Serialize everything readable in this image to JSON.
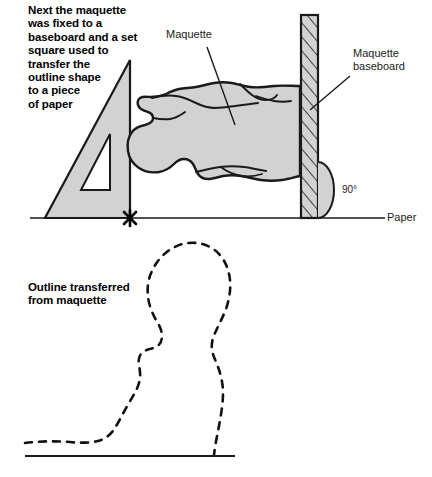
{
  "figure": {
    "title_block": {
      "heading": "Next the maquette\nwas fixed to a\nbaseboard and a set\nsquare used to\ntransfer the\noutline shape\nto a piece\nof paper",
      "caption": "Outline transferred\nfrom maquette"
    },
    "labels": {
      "maquette": "Maquette",
      "baseboard": "Maquette\nbaseboard",
      "angle": "90°",
      "paper": "Paper"
    },
    "colors": {
      "fill_gray": "#d2d2d2",
      "stroke": "#1a1a1a",
      "background": "#ffffff",
      "label_text": "#1c1c1c"
    },
    "elements": {
      "set_square": "right-triangle set square with inner triangular cutout, vertical edge at right",
      "maquette_blob": "gray organic reclining figure, head at left, resting against baseboard",
      "baseboard": "narrow vertical hatched board at right",
      "angle_arc": "quarter/semicircular gray arc marking the right angle at board base",
      "cross_mark": "bold x mark where set square vertical edge meets paper line",
      "paper_line": "horizontal rule representing sheet of paper",
      "dashed_outline": "dashed profile outline of maquette, rotated upright",
      "outline_baseline": "horizontal rule beneath dashed outline"
    }
  }
}
